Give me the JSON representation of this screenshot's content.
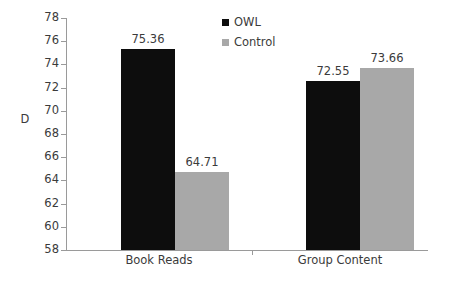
{
  "chart_data": {
    "type": "bar",
    "title": "",
    "subtitle": "",
    "xlabel": "",
    "ylabel": "D",
    "categories": [
      "Book Reads",
      "Group Content"
    ],
    "series": [
      {
        "name": "OWL",
        "color": "#0d0d0d",
        "values": [
          75.36,
          72.55
        ]
      },
      {
        "name": "Control",
        "color": "#a8a8a8",
        "values": [
          64.71,
          73.66
        ]
      }
    ],
    "grouped_values": [
      {
        "category": "Book Reads",
        "OWL": 75.36,
        "Control": 72.55
      },
      {
        "category": "Group Content",
        "OWL": 64.71,
        "Control": 73.66
      }
    ],
    "data_labels": [
      "75.36",
      "72.55",
      "64.71",
      "73.66"
    ],
    "ylim": [
      58,
      78
    ],
    "ytick_step": 2,
    "yticks": [
      78,
      76,
      74,
      72,
      70,
      68,
      66,
      64,
      62,
      60,
      58
    ],
    "ytick_labels": [
      "78",
      "76",
      "74",
      "72",
      "70",
      "68",
      "66",
      "64",
      "62",
      "60",
      "58"
    ],
    "grid": false,
    "legend_position": "top-center",
    "axis_color": "#9a9a9a",
    "text_color": "#3b3b3b",
    "background": "#ffffff"
  },
  "legend": {
    "items": [
      {
        "label": "OWL",
        "color": "#0d0d0d"
      },
      {
        "label": "Control",
        "color": "#a8a8a8"
      }
    ]
  },
  "bars": [
    {
      "label": "75.36",
      "series": "OWL",
      "category": "Book Reads"
    },
    {
      "label": "72.55",
      "series": "Control",
      "category": "Book Reads"
    },
    {
      "label": "64.71",
      "series": "OWL",
      "category": "Group Content"
    },
    {
      "label": "73.66",
      "series": "Control",
      "category": "Group Content"
    }
  ]
}
